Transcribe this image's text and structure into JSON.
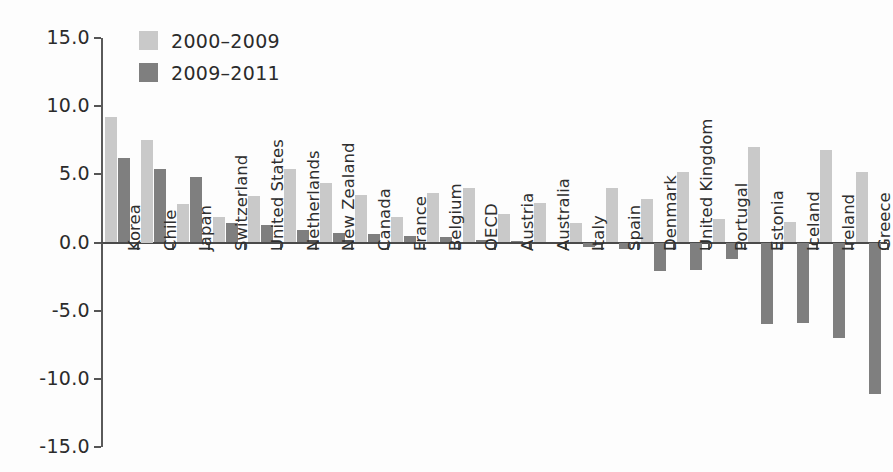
{
  "chart_data": {
    "type": "bar",
    "title": "",
    "xlabel": "",
    "ylabel": "",
    "ylim": [
      -15.0,
      15.0
    ],
    "ytick_labels": [
      "15.0",
      "10.0",
      "5.0",
      "0.0",
      "-5.0",
      "-10.0",
      "-15.0"
    ],
    "ytick_values": [
      15.0,
      10.0,
      5.0,
      0.0,
      -5.0,
      -10.0,
      -15.0
    ],
    "grid": false,
    "legend_position": "top-left",
    "categories": [
      "Korea",
      "Chile",
      "Japan",
      "Switzerland",
      "United States",
      "Netherlands",
      "New Zealand",
      "Canada",
      "France",
      "Belgium",
      "OECD",
      "Austria",
      "Australia",
      "Italy",
      "Spain",
      "Denmark",
      "United Kingdom",
      "Portugal",
      "Estonia",
      "Iceland",
      "Ireland",
      "Greece"
    ],
    "series": [
      {
        "name": "2000–2009",
        "color": "#c9c9c9",
        "values": [
          9.2,
          7.5,
          2.8,
          1.9,
          3.4,
          5.4,
          4.4,
          3.5,
          1.9,
          3.6,
          4.0,
          2.1,
          2.9,
          1.4,
          4.0,
          3.2,
          5.2,
          1.7,
          7.0,
          1.5,
          6.8,
          5.2
        ]
      },
      {
        "name": "2009–2011",
        "color": "#7f7f7f",
        "values": [
          6.2,
          5.4,
          4.8,
          1.4,
          1.3,
          0.9,
          0.7,
          0.6,
          0.5,
          0.4,
          0.2,
          0.1,
          0.0,
          -0.3,
          -0.5,
          -2.1,
          -2.0,
          -1.2,
          -6.0,
          -5.9,
          -7.0,
          -11.1
        ]
      }
    ]
  },
  "legend": {
    "items": [
      {
        "label": "2000–2009",
        "color": "#c9c9c9"
      },
      {
        "label": "2009–2011",
        "color": "#7f7f7f"
      }
    ]
  }
}
